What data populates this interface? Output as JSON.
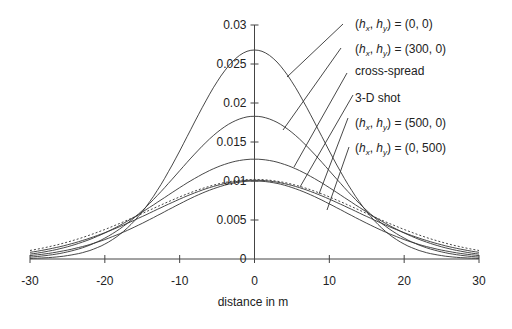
{
  "chart_data": {
    "type": "line",
    "title": "",
    "xlabel": "distance in m",
    "ylabel": "",
    "xlim": [
      -30,
      30
    ],
    "ylim": [
      0,
      0.03
    ],
    "grid": false,
    "x_ticks": [
      -30,
      -20,
      -10,
      0,
      10,
      20,
      30
    ],
    "x_tick_labels": [
      "-30",
      "-20",
      "-10",
      "0",
      "10",
      "20",
      "30"
    ],
    "y_ticks": [
      0,
      0.005,
      0.01,
      0.015,
      0.02,
      0.025,
      0.03
    ],
    "y_tick_labels": [
      "0",
      "0.005",
      "0.01",
      "0.015",
      "0.02",
      "0.025",
      "0.03"
    ],
    "legend_position": "right, with leader lines",
    "x": [
      -30,
      -27.5,
      -25,
      -22.5,
      -20,
      -17.5,
      -15,
      -12.5,
      -10,
      -7.5,
      -5,
      -2.5,
      0,
      2.5,
      5,
      7.5,
      10,
      12.5,
      15,
      17.5,
      20,
      22.5,
      25,
      27.5,
      30
    ],
    "series": [
      {
        "name": "(h_x, h_y) = (0, 0)",
        "style": "solid",
        "peak": 0.0268,
        "sigma": 8.7,
        "values": [
          0.0001,
          0.0002,
          0.0005,
          0.001,
          0.0019,
          0.0035,
          0.0061,
          0.0095,
          0.0138,
          0.0184,
          0.0226,
          0.0257,
          0.0268,
          0.0257,
          0.0226,
          0.0184,
          0.0138,
          0.0095,
          0.0061,
          0.0035,
          0.0019,
          0.001,
          0.0005,
          0.0002,
          0.0001
        ]
      },
      {
        "name": "(h_x, h_y) = (300, 0)",
        "style": "solid",
        "peak": 0.0183,
        "sigma": 10.2,
        "values": [
          0.0002,
          0.0004,
          0.0009,
          0.0016,
          0.0027,
          0.0043,
          0.0062,
          0.0086,
          0.0112,
          0.0139,
          0.0162,
          0.0178,
          0.0183,
          0.0178,
          0.0162,
          0.0139,
          0.0112,
          0.0086,
          0.0062,
          0.0043,
          0.0027,
          0.0016,
          0.0009,
          0.0004,
          0.0002
        ]
      },
      {
        "name": "cross-spread",
        "style": "solid",
        "peak": 0.0128,
        "sigma": 12.2,
        "values": [
          0.0006,
          0.001,
          0.0015,
          0.0023,
          0.0033,
          0.0045,
          0.0059,
          0.0074,
          0.009,
          0.0105,
          0.0117,
          0.0125,
          0.0128,
          0.0125,
          0.0117,
          0.0105,
          0.009,
          0.0074,
          0.0059,
          0.0045,
          0.0033,
          0.0023,
          0.0015,
          0.001,
          0.0006
        ]
      },
      {
        "name": "3-D shot",
        "style": "dashed",
        "peak": 0.0102,
        "sigma": 14.2,
        "values": [
          0.0011,
          0.0016,
          0.0022,
          0.0029,
          0.0037,
          0.0047,
          0.0058,
          0.0069,
          0.008,
          0.0089,
          0.0096,
          0.0101,
          0.0102,
          0.0101,
          0.0096,
          0.0089,
          0.008,
          0.0069,
          0.0058,
          0.0047,
          0.0037,
          0.0029,
          0.0022,
          0.0016,
          0.0011
        ]
      },
      {
        "name": "(h_x, h_y) = (500, 0)",
        "style": "solid",
        "peak": 0.0101,
        "sigma": 13.5,
        "values": [
          0.0008,
          0.0013,
          0.0018,
          0.0025,
          0.0033,
          0.0043,
          0.0055,
          0.0066,
          0.0077,
          0.0087,
          0.0095,
          0.0099,
          0.0101,
          0.0099,
          0.0095,
          0.0087,
          0.0077,
          0.0066,
          0.0055,
          0.0043,
          0.0033,
          0.0025,
          0.0018,
          0.0013,
          0.0008
        ]
      },
      {
        "name": "(h_x, h_y) = (0, 500)",
        "style": "solid",
        "peak": 0.01,
        "sigma": 12.0,
        "values": [
          0.0004,
          0.0007,
          0.0011,
          0.0017,
          0.0025,
          0.0035,
          0.0046,
          0.0058,
          0.007,
          0.0082,
          0.0092,
          0.0098,
          0.01,
          0.0098,
          0.0092,
          0.0082,
          0.007,
          0.0058,
          0.0046,
          0.0035,
          0.0025,
          0.0017,
          0.0011,
          0.0007,
          0.0004
        ]
      }
    ],
    "legend": [
      {
        "prefix": "(",
        "h1": "h",
        "s1": "x",
        "mid": ", ",
        "h2": "h",
        "s2": "y",
        "suffix": ") = (0, 0)",
        "plain": "",
        "label_x": 355,
        "label_y": 28,
        "line": [
          343,
          24,
          287,
          77
        ]
      },
      {
        "prefix": "(",
        "h1": "h",
        "s1": "x",
        "mid": ", ",
        "h2": "h",
        "s2": "y",
        "suffix": ") = (300, 0)",
        "plain": "",
        "label_x": 355,
        "label_y": 53,
        "line": [
          341,
          48,
          283,
          130
        ]
      },
      {
        "prefix": "",
        "h1": "",
        "s1": "",
        "mid": "",
        "h2": "",
        "s2": "",
        "suffix": "",
        "plain": "cross-spread",
        "label_x": 355,
        "label_y": 75,
        "line": [
          347,
          73,
          294,
          167
        ]
      },
      {
        "prefix": "",
        "h1": "",
        "s1": "",
        "mid": "",
        "h2": "",
        "s2": "",
        "suffix": "",
        "plain": "3-D shot",
        "label_x": 355,
        "label_y": 102,
        "line": [
          353,
          95,
          300,
          187
        ]
      },
      {
        "prefix": "(",
        "h1": "h",
        "s1": "x",
        "mid": ", ",
        "h2": "h",
        "s2": "y",
        "suffix": ") = (500, 0)",
        "plain": "",
        "label_x": 355,
        "label_y": 127,
        "line": [
          348,
          118,
          319,
          194
        ]
      },
      {
        "prefix": "(",
        "h1": "h",
        "s1": "x",
        "mid": ", ",
        "h2": "h",
        "s2": "y",
        "suffix": ") = (0, 500)",
        "plain": "",
        "label_x": 355,
        "label_y": 152,
        "line": [
          349,
          147,
          327,
          210
        ]
      }
    ]
  },
  "colors": {
    "line": "#333333",
    "axis": "#444444",
    "text": "#222222",
    "background": "#ffffff"
  }
}
